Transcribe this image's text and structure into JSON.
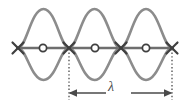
{
  "diagram": {
    "background_color": "#ffffff",
    "wave_color": "#8c8c8c",
    "axis_color": "#6e6e6e",
    "marker_color": "#3f3f3f",
    "dotted_color": "#4a4a4a",
    "arrow_color": "#4a4a4a",
    "wave": {
      "loops": 3,
      "amplitude_px": 40,
      "axis_y": 48,
      "x_start": 18,
      "x_end": 172,
      "half_wavelength_px": 51.3
    },
    "nodes": {
      "marker": "x-marker",
      "label": "node",
      "count": 4,
      "x_positions": [
        18,
        69,
        121,
        172
      ],
      "y": 48
    },
    "antinodes": {
      "marker": "o-marker",
      "label": "antinode",
      "count": 3,
      "x_positions": [
        43,
        95,
        146
      ],
      "y": 48
    },
    "guide_lines": {
      "style": "dotted",
      "x_positions": [
        69,
        172
      ],
      "y_top": 48,
      "y_bottom": 100
    },
    "measurement": {
      "symbol": "λ",
      "name": "wavelength",
      "arrow_y": 93,
      "left_x": 69,
      "right_x": 172,
      "label_x": 110,
      "label_y": 87
    }
  }
}
